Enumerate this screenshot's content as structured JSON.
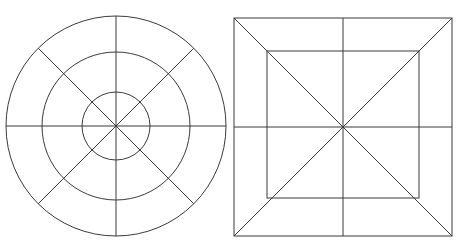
{
  "figure": {
    "background_color": "#ffffff",
    "stroke_color": "#3a3a3a",
    "stroke_width": 1,
    "canvas": {
      "width": 459,
      "height": 242
    }
  },
  "chart_data": {
    "type": "diagram",
    "xlabel": "",
    "ylabel": "",
    "grid": false,
    "legend": null,
    "shapes": [
      {
        "name": "concentric-circles",
        "label": "Concentric circles with 8-way radial division",
        "kind": "circles",
        "center": [
          116,
          126
        ],
        "radii": [
          110,
          74,
          34
        ],
        "ring_count": 3,
        "radial_lines": 8,
        "radial_angles_deg": [
          0,
          45,
          90,
          135,
          180,
          225,
          270,
          315
        ],
        "diameter_lines": 4
      },
      {
        "name": "nested-squares",
        "label": "Nested squares with full diagonals and midlines",
        "kind": "squares",
        "center": [
          343,
          127
        ],
        "outer_square": {
          "x1": 234,
          "y1": 18,
          "x2": 452,
          "y2": 236,
          "side": 218
        },
        "inner_square": {
          "x1": 267,
          "y1": 51,
          "x2": 419,
          "y2": 198,
          "width": 152,
          "height": 147
        },
        "square_count": 2,
        "diagonal_lines": 2,
        "midlines": 2
      }
    ]
  },
  "left_figure": {
    "name": "circle-diagram",
    "caption": "Circle",
    "circles": [
      {
        "id": "outer-circle",
        "cx": 116,
        "cy": 126,
        "r": 110
      },
      {
        "id": "middle-circle",
        "cx": 116,
        "cy": 126,
        "r": 74
      },
      {
        "id": "inner-circle",
        "cx": 116,
        "cy": 126,
        "r": 34
      }
    ],
    "lines": [
      {
        "id": "horizontal-diameter",
        "x1": 6,
        "y1": 126,
        "x2": 226,
        "y2": 126
      },
      {
        "id": "vertical-diameter",
        "x1": 116,
        "y1": 16,
        "x2": 116,
        "y2": 236
      },
      {
        "id": "diagonal-nw-se",
        "x1": 38.2,
        "y1": 48.2,
        "x2": 193.8,
        "y2": 203.8
      },
      {
        "id": "diagonal-ne-sw",
        "x1": 193.8,
        "y1": 48.2,
        "x2": 38.2,
        "y2": 203.8
      }
    ]
  },
  "right_figure": {
    "name": "square-diagram",
    "caption": "Square",
    "rects": [
      {
        "id": "outer-square",
        "x": 234,
        "y": 18,
        "width": 218,
        "height": 218
      },
      {
        "id": "inner-square",
        "x": 267,
        "y": 51,
        "width": 152,
        "height": 147
      }
    ],
    "lines": [
      {
        "id": "diagonal-tl-br",
        "x1": 234,
        "y1": 18,
        "x2": 452,
        "y2": 236
      },
      {
        "id": "diagonal-tr-bl",
        "x1": 452,
        "y1": 18,
        "x2": 234,
        "y2": 236
      },
      {
        "id": "horizontal-midline",
        "x1": 234,
        "y1": 127,
        "x2": 452,
        "y2": 127
      },
      {
        "id": "vertical-midline",
        "x1": 343,
        "y1": 18,
        "x2": 343,
        "y2": 236
      }
    ]
  }
}
